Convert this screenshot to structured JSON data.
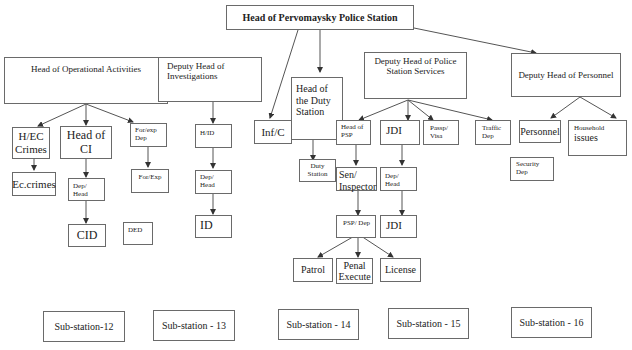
{
  "diagram": {
    "root": "Head of Pervomaysky Police Station",
    "deputies": {
      "operational": "Head of Operational Activities",
      "investigations": "Deputy Head of Investigations",
      "inf_c": "Inf/C",
      "duty": "Head of the Duty Station",
      "services": "Deputy Head of Police Station Services",
      "personnel": "Deputy Head of Personnel"
    },
    "operational_children": {
      "hec_crimes": "H/EC Crimes",
      "ec_crimes": "Ec.crimes",
      "head_ci": "Head of CI",
      "dep_head": "Dep/ Head",
      "cid": "CID",
      "ded": "DED",
      "forexp_dep": "For/exp Dep",
      "forexp": "For/Exp"
    },
    "investigations_children": {
      "hid": "H/ID",
      "dep_head": "Dep/ Head",
      "id": "ID"
    },
    "duty_children": {
      "duty_station": "Duty Station"
    },
    "services_children": {
      "head_psp": "Head of PSP",
      "sen_inspector": "Sen/ Inspector",
      "psp_dep": "PSP/ Dep",
      "patrol": "Patrol",
      "penal_execute": "Penal Execute",
      "license": "License",
      "jdi": "JDI",
      "jdi_dep_head": "Dep/ Head",
      "jdi_unit": "JDI",
      "passp_visa": "Passp/ Visa",
      "traffic_dep": "Traffic Dep"
    },
    "personnel_children": {
      "personnel": "Personnel",
      "household": "Household issues",
      "household_small": "Household",
      "household_big": "issues",
      "security": "Security Dep"
    },
    "substations": [
      "Sub-station-12",
      "Sub-station - 13",
      "Sub-station - 14",
      "Sub-station - 15",
      "Sub-station - 16"
    ]
  },
  "colors": {
    "line": "#555555",
    "border": "#6a6a6a",
    "text": "#222222"
  }
}
